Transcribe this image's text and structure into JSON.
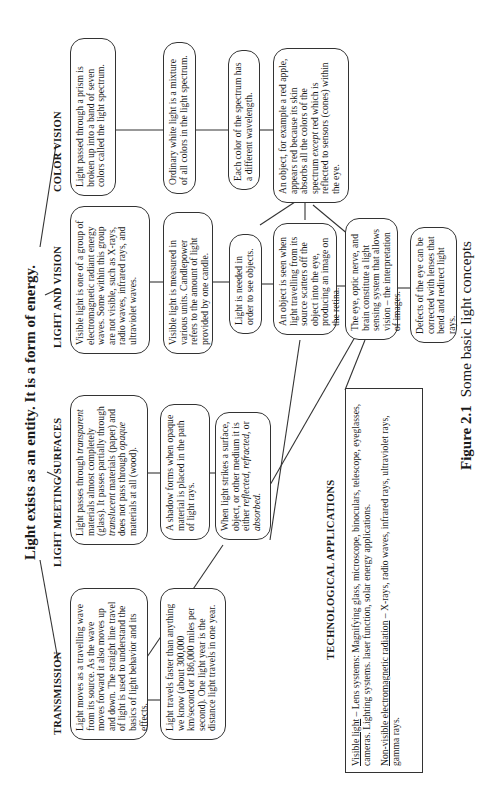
{
  "title": "Light exists as an entity.  It is a form of energy.",
  "branches": {
    "transmission": {
      "header": "TRANSMISSION",
      "boxes": [
        "Light moves as a travelling wave from its source. As the wave moves forward it also moves up and down. The straight line travel of light is used to understand the basics of light behavior and its effects.",
        "Light travels faster than anything we know (about 300,000 km/second or 186,000 miles per second). One light year is the distance light travels in one year."
      ]
    },
    "surfaces": {
      "header": "LIGHT MEETING SURFACES",
      "box1": {
        "t1": "Light passes through ",
        "i1": "transparent",
        "t2": " materials almost completely (glass). It passes partially through ",
        "i2": "translucent",
        "t3": " materials (paper) and does not pass through ",
        "i3": "opaque",
        "t4": " materials at all (wood)."
      },
      "box2": "A shadow forms when opaque material is placed in the path of light rays.",
      "box3": {
        "t1": "When light strikes a surface, object, or other medium it is either ",
        "i1": "reflected, refracted,",
        "t2": " or ",
        "i2": "absorbed."
      }
    },
    "vision": {
      "header": "LIGHT AND VISION",
      "boxes": [
        "Visible light is one of a group of electromagnetic radiant energy waves. Some within this group are not visible, such as X-rays, radio waves, infrared rays, and ultraviolet waves.",
        "Visible light is measured in various units. Candlepower refers to the amount of light provided by one candle.",
        "Light is needed in order to see objects.",
        "An object is seen when light travelling from its source scatters off the object into the eye, producing an image on the retina.",
        "The eye, optic nerve, and brain constitute a light sensing system that allows vision – the interpretation of images.",
        "Defects of the eye can be corrected with lenses that bend and redirect light rays."
      ]
    },
    "color": {
      "header": "COLOR VISION",
      "boxes": [
        "Light passed through a prism is broken up into a band of seven colors called the light spectrum.",
        "Ordinary white light is a mixture of all colors in the light spectrum.",
        "Each color of the spectrum has a different wavelength."
      ],
      "box4": {
        "t1": "An object, for example a red apple, appears red because its skin absorbs all the colors of the spectrum ",
        "i1": "except",
        "t2": " red which is reflected to sensors (cones) within the eye."
      }
    }
  },
  "tech": {
    "header": "TECHNOLOGICAL APPLICATIONS",
    "visible_label": "Visible light",
    "visible_text": " – Lens systems: Magnifying glass, microscope, binoculars, telescope, eyeglasses, cameras.  Lighting systems.  laser function, solar energy applications.",
    "nonvisible_label": "Non-visible electromagnetic radiation",
    "nonvisible_text": " – X-rays, radio waves, infrared rays, ultraviolet rays, gamma rays."
  },
  "caption": {
    "label": "Figure 2.1",
    "text": "Some basic light concepts"
  }
}
